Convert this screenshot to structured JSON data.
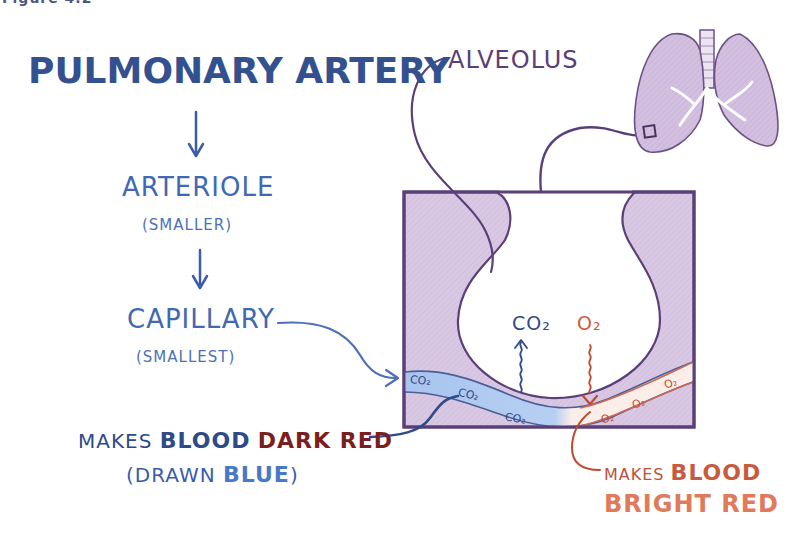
{
  "figure": {
    "caption_fragment": "Figure 4.2"
  },
  "flow": {
    "title": "PULMONARY ARTERY",
    "step1": {
      "label": "ARTERIOLE",
      "note": "(SMALLER)"
    },
    "step2": {
      "label": "CAPILLARY",
      "note": "(SMALLEST)"
    }
  },
  "left_annotation": {
    "prefix": "MAKES",
    "blood": "BLOOD",
    "color_word": "DARK RED",
    "paren_open": "(DRAWN",
    "blue_word": "BLUE",
    "paren_close": ")"
  },
  "right_annotation": {
    "prefix": "MAKES",
    "blood": "BLOOD",
    "color_word": "BRIGHT RED"
  },
  "diagram": {
    "alveolus_label": "ALVEOLUS",
    "co2_label": "CO₂",
    "o2_label": "O₂",
    "capillary_co2_labels": [
      "CO₂",
      "CO₂",
      "CO₂"
    ],
    "capillary_o2_labels": [
      "O₂",
      "O₂",
      "O₂",
      "O₂"
    ]
  },
  "colors": {
    "tissue_fill": "#d9c8e3",
    "outline": "#5a3f78",
    "deoxygenated_blood": "#a8c4ef",
    "oxygenated_blood": "#fbeee9",
    "blue_ink": "#34518f",
    "red_ink": "#c85a3e",
    "dark_red_ink": "#7a1f1f"
  }
}
